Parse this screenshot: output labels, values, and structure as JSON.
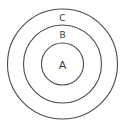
{
  "diagram": {
    "type": "concentric-circles",
    "center": {
      "x": 62.5,
      "y": 64
    },
    "stroke_color": "#4a4a4a",
    "rings": [
      {
        "label": "A",
        "radius": 21,
        "label_x": 62.5,
        "label_y": 65,
        "font_size": 11
      },
      {
        "label": "B",
        "radius": 39,
        "label_x": 62.5,
        "label_y": 35,
        "font_size": 9
      },
      {
        "label": "C",
        "radius": 55,
        "label_x": 62.5,
        "label_y": 18,
        "font_size": 9
      }
    ]
  }
}
